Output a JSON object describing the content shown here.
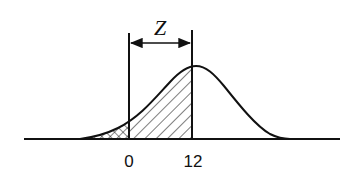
{
  "diagram": {
    "type": "normal-distribution-curve",
    "annotation_label": "Z",
    "tick_labels": [
      {
        "value": "0",
        "position": "left-boundary"
      },
      {
        "value": "12",
        "position": "right-boundary"
      }
    ],
    "regions": [
      {
        "name": "left-tail",
        "range": "below 0",
        "fill": "cross-hatch"
      },
      {
        "name": "z-interval",
        "range": "0 to 12",
        "fill": "diagonal-hatch"
      }
    ],
    "colors": {
      "stroke": "#111111",
      "background": "#ffffff"
    }
  }
}
